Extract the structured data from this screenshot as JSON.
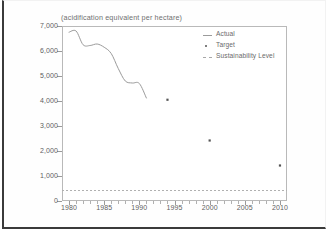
{
  "figure": {
    "title": "(acidification equivalent per hectare)"
  },
  "legend": {
    "items": [
      {
        "label": "Actual",
        "key": "line",
        "color": "#9b9b9b"
      },
      {
        "label": "Target",
        "key": "dot",
        "color": "#555555"
      },
      {
        "label": "Sustainability Level",
        "key": "dash",
        "color": "#a8a8a8"
      }
    ]
  },
  "axes": {
    "y_ticks": [
      "7,000",
      "6,000",
      "5,000",
      "4,000",
      "3,000",
      "2,000",
      "1,000",
      "0"
    ],
    "x_ticks": [
      "1980",
      "1985",
      "1990",
      "1995",
      "2000",
      "2005",
      "2010"
    ]
  },
  "chart_data": {
    "type": "line",
    "title": "(acidification equivalent per hectare)",
    "xlabel": "",
    "ylabel": "",
    "xlim": [
      1979,
      2011
    ],
    "ylim": [
      0,
      7000
    ],
    "yticks": [
      0,
      1000,
      2000,
      3000,
      4000,
      5000,
      6000,
      7000
    ],
    "ytick_labels": [
      "0",
      "1,000",
      "2,000",
      "3,000",
      "4,000",
      "5,000",
      "6,000",
      "7,000"
    ],
    "xticks": [
      1980,
      1985,
      1990,
      1995,
      2000,
      2005,
      2010
    ],
    "xtick_labels": [
      "1980",
      "1985",
      "1990",
      "1995",
      "2000",
      "2005",
      "2010"
    ],
    "x_minor_tick_interval": 1,
    "grid": false,
    "legend_position": "top-right",
    "series": [
      {
        "name": "Actual",
        "type": "line",
        "color": "#9b9b9b",
        "x": [
          1980,
          1981,
          1982,
          1983,
          1984,
          1985,
          1986,
          1987,
          1988,
          1989,
          1990,
          1991
        ],
        "values": [
          6750,
          6800,
          6250,
          6220,
          6280,
          6150,
          5900,
          5300,
          4800,
          4720,
          4700,
          4120
        ]
      },
      {
        "name": "Target",
        "type": "scatter",
        "color": "#555555",
        "x": [
          1994,
          2000,
          2010
        ],
        "values": [
          4050,
          2420,
          1420
        ]
      },
      {
        "name": "Sustainability Level",
        "type": "hline",
        "color": "#a8a8a8",
        "style": "dashed",
        "value": 420
      }
    ]
  }
}
